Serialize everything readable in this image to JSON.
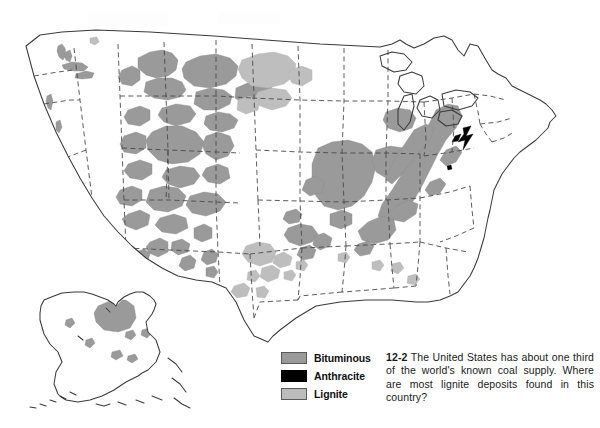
{
  "figure": {
    "map_name": "us-coal-deposits-map"
  },
  "legend": {
    "name": "coal-type-legend",
    "items": [
      {
        "label": "Bituminous",
        "color": "#9a9a9a",
        "icon": "bituminous-swatch"
      },
      {
        "label": "Anthracite",
        "color": "#000000",
        "icon": "anthracite-swatch"
      },
      {
        "label": "Lignite",
        "color": "#bcbcbc",
        "icon": "lignite-swatch"
      }
    ]
  },
  "caption": {
    "number": "12-2",
    "text": "The United States has about one third of the world's known coal supply. Where are most lignite deposits found in this country?"
  },
  "map": {
    "regions_label": "coal-deposit-regions",
    "border_color": "#3a3a3a",
    "state_line_color": "#4a4a4a",
    "background": "#ffffff",
    "insets": [
      {
        "name": "alaska-inset",
        "label": ""
      }
    ]
  }
}
